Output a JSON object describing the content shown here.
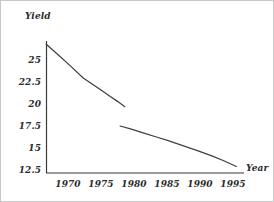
{
  "chart_data": {
    "type": "line",
    "title": "",
    "xlabel": "Year",
    "ylabel": "Yield",
    "xlim": [
      1966.0,
      1996.8
    ],
    "ylim": [
      11.8,
      27.4
    ],
    "grid": false,
    "legend": null,
    "xticks": [
      1970,
      1975,
      1980,
      1985,
      1990,
      1995
    ],
    "xtick_labels": [
      "1970",
      "1975",
      "1980",
      "1985",
      "1990",
      "1995"
    ],
    "yticks": [
      25,
      22.5,
      20,
      17.5,
      15,
      12.5
    ],
    "ytick_labels": [
      "25",
      "22.5",
      "20",
      "17.5",
      "15",
      "12.5"
    ],
    "line_color": "#404040",
    "series": [
      {
        "name": "segment-1",
        "x": [
          1966.7,
          1968.5,
          1970.4,
          1972.3,
          1973.6,
          1975.0,
          1976.4,
          1977.5,
          1978.6
        ],
        "y": [
          26.8,
          25.6,
          24.3,
          22.95,
          22.3,
          21.6,
          20.85,
          20.3,
          19.7
        ]
      },
      {
        "name": "segment-2",
        "x": [
          1977.9,
          1979.6,
          1981.5,
          1983.4,
          1985.3,
          1987.5,
          1989.6,
          1991.8,
          1993.6,
          1995.5
        ],
        "y": [
          17.5,
          17.15,
          16.7,
          16.25,
          15.8,
          15.25,
          14.7,
          14.1,
          13.55,
          12.9
        ]
      }
    ]
  },
  "axis_titles": {
    "y": "Yield",
    "x": "Year"
  }
}
